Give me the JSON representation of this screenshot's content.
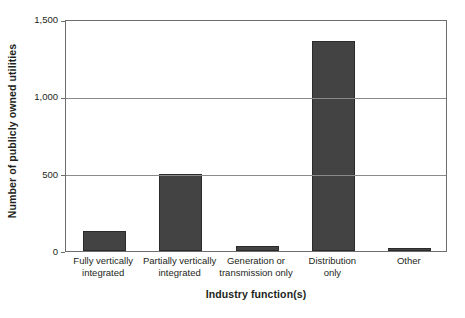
{
  "chart_data": {
    "type": "bar",
    "title": "",
    "xlabel": "Industry function(s)",
    "ylabel": "Number of publicly owned utilities",
    "categories": [
      "Fully vertically integrated",
      "Partially vertically integrated",
      "Generation or transmission only",
      "Distribution only",
      "Other"
    ],
    "category_lines": [
      [
        "Fully vertically",
        "integrated"
      ],
      [
        "Partially vertically",
        "integrated"
      ],
      [
        "Generation or",
        "transmission only"
      ],
      [
        "Distribution",
        "only"
      ],
      [
        "Other"
      ]
    ],
    "values": [
      130,
      500,
      32,
      1360,
      18
    ],
    "ylim": [
      0,
      1500
    ],
    "yticks": [
      0,
      500,
      1000,
      1500
    ],
    "ytick_labels": [
      "0",
      "500",
      "1,000",
      "1,500"
    ],
    "grid": true,
    "legend": "none",
    "bar_color": "#434343",
    "bar_edge_color": "#2b2b2b",
    "axis_color": "#6e6e6e",
    "grid_color": "#8a8a8a",
    "text_color": "#231f20"
  }
}
